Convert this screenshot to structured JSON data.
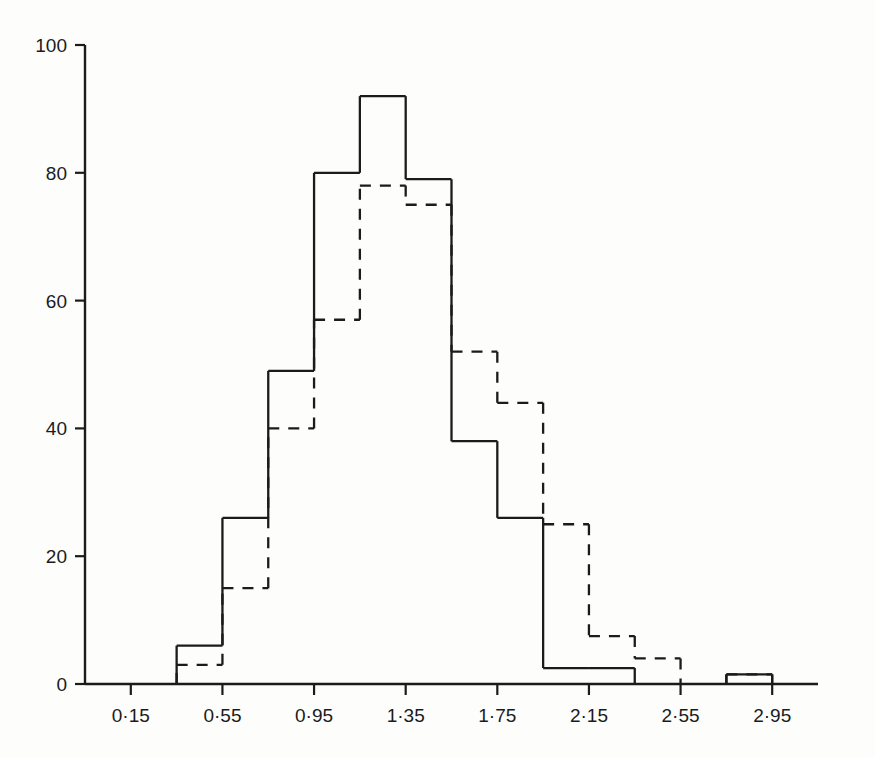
{
  "chart_data": {
    "type": "bar",
    "title": "",
    "subtitle": "",
    "xlabel": "",
    "ylabel": "",
    "xlim": [
      -0.05,
      3.15
    ],
    "ylim": [
      0,
      100
    ],
    "grid": false,
    "legend": "none",
    "bin_width": 0.4,
    "x_tick_labels": [
      "0·15",
      "0·55",
      "0·95",
      "1·35",
      "1·75",
      "2·15",
      "2·55",
      "2·95"
    ],
    "x_tick_values": [
      0.15,
      0.55,
      0.95,
      1.35,
      1.75,
      2.15,
      2.55,
      2.95
    ],
    "y_tick_labels": [
      "0",
      "20",
      "40",
      "60",
      "80",
      "100"
    ],
    "y_tick_values": [
      0,
      20,
      40,
      60,
      80,
      100
    ],
    "bin_centers": [
      0.15,
      0.55,
      0.95,
      1.35,
      1.75,
      2.15,
      2.55,
      2.95
    ],
    "bin_edges": [
      -0.05,
      0.35,
      0.55,
      0.75,
      0.95,
      1.15,
      1.35,
      1.55,
      1.75,
      1.95,
      2.15,
      2.35,
      2.55,
      2.75,
      2.95,
      3.15
    ],
    "series": [
      {
        "name": "solid",
        "style": "solid",
        "edges": [
          0.35,
          0.55,
          0.75,
          0.95,
          1.15,
          1.35,
          1.55,
          1.75,
          1.95,
          2.15,
          2.35,
          2.75,
          2.95
        ],
        "values": [
          6,
          26,
          49,
          80,
          92,
          79,
          38,
          26,
          2.5,
          2.5,
          0,
          1.5
        ]
      },
      {
        "name": "dashed",
        "style": "dashed",
        "edges": [
          0.35,
          0.55,
          0.75,
          0.95,
          1.15,
          1.35,
          1.55,
          1.75,
          1.95,
          2.15,
          2.35,
          2.55,
          2.75,
          2.95
        ],
        "values": [
          3,
          15,
          40,
          57,
          78,
          75,
          52,
          44,
          25,
          7.5,
          4,
          0,
          1.5
        ]
      }
    ],
    "colors": {
      "axis": "#1b1b1b",
      "solid_line": "#1b1b1b",
      "dashed_line": "#1b1b1b",
      "background": "#fdfdfc"
    }
  }
}
